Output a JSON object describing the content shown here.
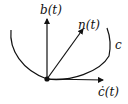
{
  "diagram": {
    "labels": {
      "binormal": "b(t)",
      "normal": "n(t)",
      "tangent": "ċ(t)",
      "curve": "c"
    },
    "colors": {
      "stroke": "#111111",
      "background": "#ffffff"
    }
  }
}
